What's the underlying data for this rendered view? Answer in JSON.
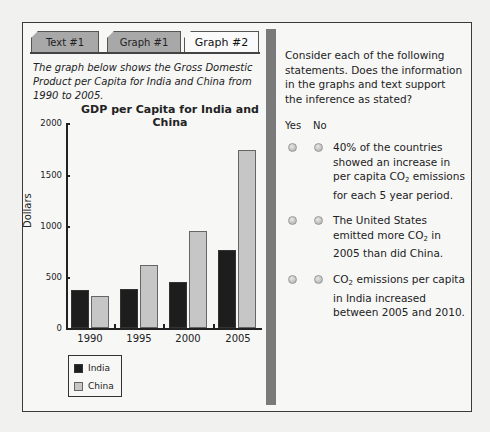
{
  "tabs": [
    {
      "label": "Text #1",
      "active": false
    },
    {
      "label": "Graph #1",
      "active": false
    },
    {
      "label": "Graph #2",
      "active": true
    }
  ],
  "left_panel": {
    "intro": "The graph below shows the Gross Domestic Product per Capita for India and China from 1990 to 2005."
  },
  "chart_data": {
    "type": "bar",
    "title": "GDP per Capita for India and China",
    "xlabel": "",
    "ylabel": "Dollars",
    "ylim": [
      0,
      2000
    ],
    "yticks": [
      "0",
      "500",
      "1000",
      "1500",
      "2000"
    ],
    "categories": [
      "1990",
      "1995",
      "2000",
      "2005"
    ],
    "series": [
      {
        "name": "India",
        "color": "#1d1d1d",
        "values": [
          375,
          380,
          450,
          765
        ]
      },
      {
        "name": "China",
        "color": "#c6c6c6",
        "values": [
          315,
          610,
          950,
          1740
        ]
      }
    ],
    "grid": false,
    "legend_position": "bottom-left"
  },
  "right_panel": {
    "intro": "Consider each of the following statements. Does the information in the graphs and text support the inference as stated?",
    "col_yes": "Yes",
    "col_no": "No",
    "statements": [
      {
        "pre": "40% of the countries showed an increase in per capita CO",
        "sub": "2",
        "post": " emissions for each 5 year period."
      },
      {
        "pre": "The United States emitted more CO",
        "sub": "2",
        "post": " in 2005 than did China."
      },
      {
        "pre": "CO",
        "sub": "2",
        "post": " emissions per capita in India increased between 2005 and 2010."
      }
    ]
  }
}
